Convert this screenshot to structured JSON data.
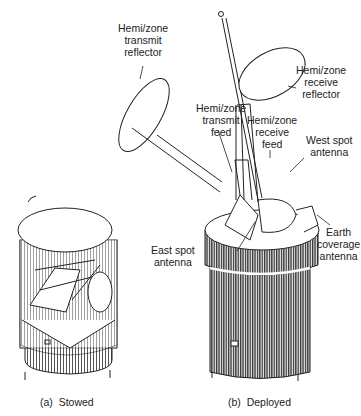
{
  "labels": {
    "transmit_reflector": "Hemi/zone\ntransmit\nreflector",
    "receive_reflector": "Hemi/zone\nreceive\nreflector",
    "transmit_feed": "Hemi/zone\ntransmit\nfeed",
    "receive_feed": "Hemi/zone\nreceive\nfeed",
    "west_spot": "West spot\nantenna",
    "east_spot": "East spot\nantenna",
    "earth_coverage": "Earth\ncoverage\nantenna"
  },
  "captions": {
    "stowed": "(a)  Stowed",
    "deployed": "(b)  Deployed"
  },
  "colors": {
    "ink": "#222222",
    "body": "#555555",
    "paper": "#ffffff"
  }
}
